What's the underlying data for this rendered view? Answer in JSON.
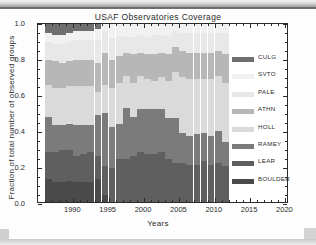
{
  "chart_data": {
    "type": "bar",
    "stacked": true,
    "title": "USAF Observatories Coverage",
    "xlabel": "Years",
    "ylabel": "Fraction of total number of observed groups",
    "xlim": [
      1985.0,
      2020.5
    ],
    "ylim": [
      0.0,
      1.0
    ],
    "xticks": [
      1990,
      1995,
      2000,
      2005,
      2010,
      2015,
      2020
    ],
    "yticks": [
      "0.0",
      "0.2",
      "0.4",
      "0.6",
      "0.8",
      "1.0"
    ],
    "grid": false,
    "legend_position": "right-outside",
    "categories": [
      1986,
      1987,
      1988,
      1989,
      1990,
      1991,
      1992,
      1993,
      1994,
      1995,
      1996,
      1997,
      1998,
      1999,
      2000,
      2001,
      2002,
      2003,
      2004,
      2005,
      2006,
      2007,
      2008,
      2009,
      2010,
      2011
    ],
    "series": [
      {
        "name": "BOULDER",
        "color": "#4a4a4a",
        "values": [
          0.13,
          0.11,
          0.11,
          0.12,
          0.11,
          0.11,
          0.11,
          0.13,
          0.04,
          0.0,
          0.0,
          0.0,
          0.0,
          0.0,
          0.0,
          0.0,
          0.0,
          0.0,
          0.0,
          0.0,
          0.0,
          0.0,
          0.0,
          0.0,
          0.0,
          0.0
        ]
      },
      {
        "name": "LEAR",
        "color": "#5f5f5f",
        "values": [
          0.15,
          0.17,
          0.18,
          0.17,
          0.15,
          0.16,
          0.17,
          0.13,
          0.16,
          0.19,
          0.24,
          0.24,
          0.26,
          0.28,
          0.27,
          0.27,
          0.28,
          0.24,
          0.22,
          0.22,
          0.21,
          0.21,
          0.23,
          0.21,
          0.22,
          0.2
        ]
      },
      {
        "name": "RAMEY",
        "color": "#7b7b7b",
        "values": [
          0.2,
          0.15,
          0.14,
          0.15,
          0.17,
          0.16,
          0.15,
          0.23,
          0.3,
          0.23,
          0.2,
          0.29,
          0.22,
          0.24,
          0.25,
          0.25,
          0.24,
          0.23,
          0.25,
          0.17,
          0.16,
          0.17,
          0.16,
          0.16,
          0.18,
          0.14
        ]
      },
      {
        "name": "HOLL",
        "color": "#dadada",
        "values": [
          0.18,
          0.21,
          0.21,
          0.21,
          0.22,
          0.22,
          0.22,
          0.13,
          0.16,
          0.22,
          0.23,
          0.18,
          0.19,
          0.19,
          0.17,
          0.16,
          0.18,
          0.21,
          0.26,
          0.31,
          0.32,
          0.31,
          0.3,
          0.32,
          0.31,
          0.33
        ]
      },
      {
        "name": "ATHN",
        "color": "#b7b7b7",
        "values": [
          0.14,
          0.15,
          0.14,
          0.14,
          0.15,
          0.15,
          0.15,
          0.16,
          0.18,
          0.16,
          0.15,
          0.13,
          0.16,
          0.13,
          0.14,
          0.15,
          0.14,
          0.15,
          0.14,
          0.15,
          0.15,
          0.15,
          0.15,
          0.15,
          0.14,
          0.16
        ]
      },
      {
        "name": "PALE",
        "color": "#e8e8e8",
        "values": [
          0.1,
          0.1,
          0.11,
          0.11,
          0.11,
          0.11,
          0.11,
          0.13,
          0.12,
          0.12,
          0.11,
          0.09,
          0.1,
          0.1,
          0.1,
          0.11,
          0.1,
          0.1,
          0.09,
          0.1,
          0.11,
          0.11,
          0.11,
          0.11,
          0.1,
          0.12
        ]
      },
      {
        "name": "SVTO",
        "color": "#f1f1f1",
        "values": [
          0.05,
          0.05,
          0.05,
          0.05,
          0.05,
          0.05,
          0.05,
          0.06,
          0.04,
          0.08,
          0.07,
          0.07,
          0.07,
          0.06,
          0.07,
          0.06,
          0.06,
          0.07,
          0.04,
          0.05,
          0.05,
          0.05,
          0.05,
          0.05,
          0.05,
          0.05
        ]
      },
      {
        "name": "CULG",
        "color": "#6f6f6f",
        "values": [
          0.05,
          0.06,
          0.06,
          0.05,
          0.04,
          0.04,
          0.04,
          0.03,
          0.0,
          0.0,
          0.0,
          0.0,
          0.0,
          0.0,
          0.0,
          0.0,
          0.0,
          0.0,
          0.0,
          0.0,
          0.0,
          0.0,
          0.0,
          0.0,
          0.0,
          0.0
        ]
      }
    ]
  },
  "chart": {
    "title": "USAF Observatories Coverage",
    "x_axis_title": "Years",
    "y_axis_title": "Fraction of total number of observed groups"
  },
  "legend": {
    "items": [
      {
        "label": "CULG",
        "color": "#6f6f6f"
      },
      {
        "label": "SVTO",
        "color": "#f1f1f1"
      },
      {
        "label": "PALE",
        "color": "#e8e8e8"
      },
      {
        "label": "ATHN",
        "color": "#b7b7b7"
      },
      {
        "label": "HOLL",
        "color": "#dadada"
      },
      {
        "label": "RAMEY",
        "color": "#7b7b7b"
      },
      {
        "label": "LEAR",
        "color": "#5f5f5f"
      },
      {
        "label": "BOULDER",
        "color": "#4a4a4a"
      }
    ]
  }
}
